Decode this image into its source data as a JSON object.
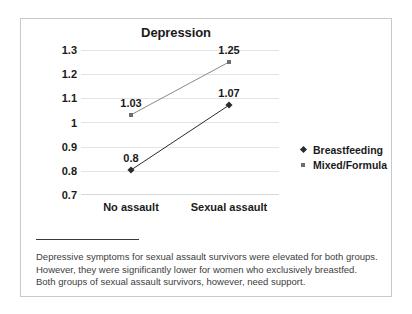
{
  "chart_data": {
    "type": "line",
    "title": "Depression",
    "xlabel": "",
    "ylabel": "",
    "categories": [
      "No assault",
      "Sexual assault"
    ],
    "series": [
      {
        "name": "Breastfeeding",
        "marker": "diamond",
        "color": "#2b2b2b",
        "values": [
          0.8,
          1.07
        ],
        "labels": [
          "0.8",
          "1.07"
        ]
      },
      {
        "name": "Mixed/Formula",
        "marker": "square",
        "color": "#6e6e6e",
        "values": [
          1.03,
          1.25
        ],
        "labels": [
          "1.03",
          "1.25"
        ]
      }
    ],
    "ylim": [
      0.7,
      1.3
    ],
    "yticks": [
      1.3,
      1.2,
      1.1,
      1.0,
      0.9,
      0.8,
      0.7
    ],
    "ytick_labels": [
      "1.3",
      "1.2",
      "1.1",
      "1",
      "0.9",
      "0.8",
      "0.7"
    ],
    "grid": true,
    "legend_position": "right"
  },
  "caption": {
    "text": "Depressive symptoms for sexual assault survivors were elevated for both groups. However, they were significantly lower for women who exclusively breastfed. Both groups of sexual assault survivors, however, need support."
  }
}
